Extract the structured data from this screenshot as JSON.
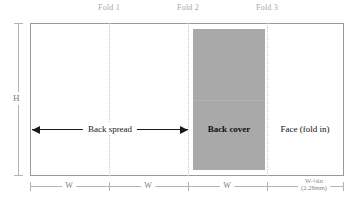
{
  "diagram": {
    "sheet": {
      "border_color": "#9a9a9a",
      "background": "#ffffff"
    },
    "fold_line_color": "#c9c9c9",
    "dimension_color": "#b4b4b4",
    "arrow_color": "#1a1a1a",
    "panel_fill": "#a9a9a9"
  },
  "fold_labels": [
    {
      "text": "Fold 1"
    },
    {
      "text": "Fold 2"
    },
    {
      "text": "Fold 3"
    }
  ],
  "height_dimension": {
    "label": "H"
  },
  "width_dimensions": [
    {
      "label": "W"
    },
    {
      "label": "W"
    },
    {
      "label": "W"
    },
    {
      "label_line1": "W-⅛in",
      "label_line2": "(2.28mm)"
    }
  ],
  "annotations": {
    "back_spread": "Back spread",
    "back_cover": "Back cover",
    "face": "Face (fold in)"
  }
}
